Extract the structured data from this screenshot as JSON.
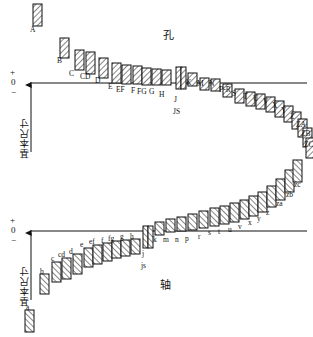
{
  "figure": {
    "title_hole": "孔",
    "title_shaft": "轴",
    "axis_label": "基本尺寸",
    "axis_plus": "+",
    "axis_zero": "0",
    "axis_minus": "−"
  },
  "chart_data": {
    "type": "scatter",
    "xlabel": "",
    "ylabel": "基本尺寸",
    "grid": false,
    "legend": null,
    "zero_line_upper_y": 83,
    "zero_line_lower_y": 231,
    "series": [
      {
        "name": "孔 (hole)",
        "case": "upper",
        "hatch": "forward",
        "points": [
          {
            "label": "A",
            "x": 33,
            "y": 4,
            "h": 22,
            "w": 9,
            "lx": 30,
            "ly": 26
          },
          {
            "label": "B",
            "x": 60,
            "y": 38,
            "h": 20,
            "w": 9,
            "lx": 57,
            "ly": 57
          },
          {
            "label": "C",
            "x": 75,
            "y": 50,
            "h": 20,
            "w": 9,
            "lx": 69,
            "ly": 70
          },
          {
            "label": "CD",
            "x": 86,
            "y": 52,
            "h": 22,
            "w": 9,
            "lx": 80,
            "ly": 73
          },
          {
            "label": "D",
            "x": 99,
            "y": 58,
            "h": 20,
            "w": 9,
            "lx": 95,
            "ly": 77
          },
          {
            "label": "E",
            "x": 112,
            "y": 63,
            "h": 20,
            "w": 9,
            "lx": 108,
            "ly": 83
          },
          {
            "label": "EF",
            "x": 122,
            "y": 65,
            "h": 19,
            "w": 9,
            "lx": 116,
            "ly": 86
          },
          {
            "label": "F",
            "x": 133,
            "y": 66,
            "h": 18,
            "w": 9,
            "lx": 131,
            "ly": 87
          },
          {
            "label": "FG",
            "x": 142,
            "y": 68,
            "h": 17,
            "w": 9,
            "lx": 137,
            "ly": 88
          },
          {
            "label": "G",
            "x": 152,
            "y": 69,
            "h": 16,
            "w": 9,
            "lx": 149,
            "ly": 88
          },
          {
            "label": "H",
            "x": 162,
            "y": 70,
            "h": 15,
            "w": 9,
            "lx": 159,
            "ly": 91
          },
          {
            "label": "J",
            "x": 176,
            "y": 67,
            "h": 22,
            "w": 5,
            "lx": 174,
            "ly": 96
          },
          {
            "label": "JS",
            "x": 181,
            "y": 67,
            "h": 22,
            "w": 5,
            "lx": 173,
            "ly": 108
          },
          {
            "label": "K",
            "x": 188,
            "y": 73,
            "h": 13,
            "w": 9,
            "lx": 186,
            "ly": 79
          },
          {
            "label": "M",
            "x": 200,
            "y": 78,
            "h": 12,
            "w": 9,
            "lx": 197,
            "ly": 80
          },
          {
            "label": "N",
            "x": 211,
            "y": 79,
            "h": 12,
            "w": 9,
            "lx": 209,
            "ly": 80
          },
          {
            "label": "P-R",
            "x": 223,
            "y": 84,
            "h": 13,
            "w": 9,
            "lx": 219,
            "ly": 86
          },
          {
            "label": "S",
            "x": 235,
            "y": 89,
            "h": 14,
            "w": 9,
            "lx": 232,
            "ly": 90
          },
          {
            "label": "T",
            "x": 246,
            "y": 92,
            "h": 14,
            "w": 9,
            "lx": 243,
            "ly": 93
          },
          {
            "label": "U",
            "x": 256,
            "y": 94,
            "h": 15,
            "w": 9,
            "lx": 253,
            "ly": 95
          },
          {
            "label": "V",
            "x": 266,
            "y": 97,
            "h": 15,
            "w": 9,
            "lx": 263,
            "ly": 98
          },
          {
            "label": "X",
            "x": 275,
            "y": 101,
            "h": 16,
            "w": 9,
            "lx": 272,
            "ly": 102
          },
          {
            "label": "Y",
            "x": 284,
            "y": 106,
            "h": 16,
            "w": 9,
            "lx": 281,
            "ly": 107
          },
          {
            "label": "Z",
            "x": 292,
            "y": 112,
            "h": 17,
            "w": 9,
            "lx": 290,
            "ly": 113
          },
          {
            "label": "ZA",
            "x": 298,
            "y": 119,
            "h": 18,
            "w": 9,
            "lx": 296,
            "ly": 121
          },
          {
            "label": "ZB",
            "x": 303,
            "y": 128,
            "h": 19,
            "w": 9,
            "lx": 301,
            "ly": 130
          },
          {
            "label": "ZC",
            "x": 306,
            "y": 138,
            "h": 20,
            "w": 9,
            "lx": 304,
            "ly": 141
          }
        ]
      },
      {
        "name": "轴 (shaft)",
        "case": "lower",
        "hatch": "backward",
        "points": [
          {
            "label": "a",
            "x": 25,
            "y": 310,
            "h": 22,
            "w": 9,
            "lx": 26,
            "ly": 304
          },
          {
            "label": "b",
            "x": 40,
            "y": 274,
            "h": 20,
            "w": 9,
            "lx": 40,
            "ly": 268
          },
          {
            "label": "c",
            "x": 52,
            "y": 262,
            "h": 20,
            "w": 9,
            "lx": 51,
            "ly": 255
          },
          {
            "label": "cd",
            "x": 62,
            "y": 258,
            "h": 21,
            "w": 9,
            "lx": 58,
            "ly": 251
          },
          {
            "label": "d",
            "x": 73,
            "y": 254,
            "h": 20,
            "w": 9,
            "lx": 69,
            "ly": 248
          },
          {
            "label": "e",
            "x": 84,
            "y": 248,
            "h": 19,
            "w": 9,
            "lx": 80,
            "ly": 241
          },
          {
            "label": "ef",
            "x": 93,
            "y": 245,
            "h": 19,
            "w": 9,
            "lx": 89,
            "ly": 238
          },
          {
            "label": "f",
            "x": 103,
            "y": 243,
            "h": 18,
            "w": 9,
            "lx": 101,
            "ly": 237
          },
          {
            "label": "fg",
            "x": 112,
            "y": 241,
            "h": 17,
            "w": 9,
            "lx": 108,
            "ly": 235
          },
          {
            "label": "g",
            "x": 121,
            "y": 240,
            "h": 16,
            "w": 9,
            "lx": 120,
            "ly": 233
          },
          {
            "label": "h",
            "x": 131,
            "y": 239,
            "h": 15,
            "w": 9,
            "lx": 130,
            "ly": 233
          },
          {
            "label": "j",
            "x": 143,
            "y": 226,
            "h": 22,
            "w": 5,
            "lx": 142,
            "ly": 250
          },
          {
            "label": "js",
            "x": 148,
            "y": 226,
            "h": 22,
            "w": 5,
            "lx": 141,
            "ly": 262
          },
          {
            "label": "k",
            "x": 155,
            "y": 222,
            "h": 13,
            "w": 9,
            "lx": 153,
            "ly": 236
          },
          {
            "label": "m",
            "x": 166,
            "y": 219,
            "h": 13,
            "w": 9,
            "lx": 163,
            "ly": 236
          },
          {
            "label": "n",
            "x": 177,
            "y": 217,
            "h": 14,
            "w": 9,
            "lx": 175,
            "ly": 236
          },
          {
            "label": "p",
            "x": 188,
            "y": 214,
            "h": 16,
            "w": 9,
            "lx": 185,
            "ly": 235
          },
          {
            "label": "r",
            "x": 199,
            "y": 211,
            "h": 17,
            "w": 9,
            "lx": 198,
            "ly": 233
          },
          {
            "label": "s",
            "x": 210,
            "y": 208,
            "h": 18,
            "w": 9,
            "lx": 208,
            "ly": 229
          },
          {
            "label": "t",
            "x": 220,
            "y": 206,
            "h": 18,
            "w": 9,
            "lx": 218,
            "ly": 228
          },
          {
            "label": "u",
            "x": 230,
            "y": 203,
            "h": 19,
            "w": 9,
            "lx": 228,
            "ly": 226
          },
          {
            "label": "v",
            "x": 240,
            "y": 200,
            "h": 19,
            "w": 9,
            "lx": 238,
            "ly": 223
          },
          {
            "label": "x",
            "x": 249,
            "y": 196,
            "h": 20,
            "w": 9,
            "lx": 248,
            "ly": 219
          },
          {
            "label": "y",
            "x": 258,
            "y": 192,
            "h": 20,
            "w": 9,
            "lx": 257,
            "ly": 215
          },
          {
            "label": "z",
            "x": 267,
            "y": 186,
            "h": 21,
            "w": 9,
            "lx": 266,
            "ly": 209
          },
          {
            "label": "za",
            "x": 276,
            "y": 179,
            "h": 21,
            "w": 9,
            "lx": 276,
            "ly": 200
          },
          {
            "label": "zb",
            "x": 285,
            "y": 170,
            "h": 22,
            "w": 9,
            "lx": 286,
            "ly": 191
          },
          {
            "label": "zc",
            "x": 293,
            "y": 160,
            "h": 22,
            "w": 9,
            "lx": 294,
            "ly": 181
          }
        ]
      }
    ]
  }
}
